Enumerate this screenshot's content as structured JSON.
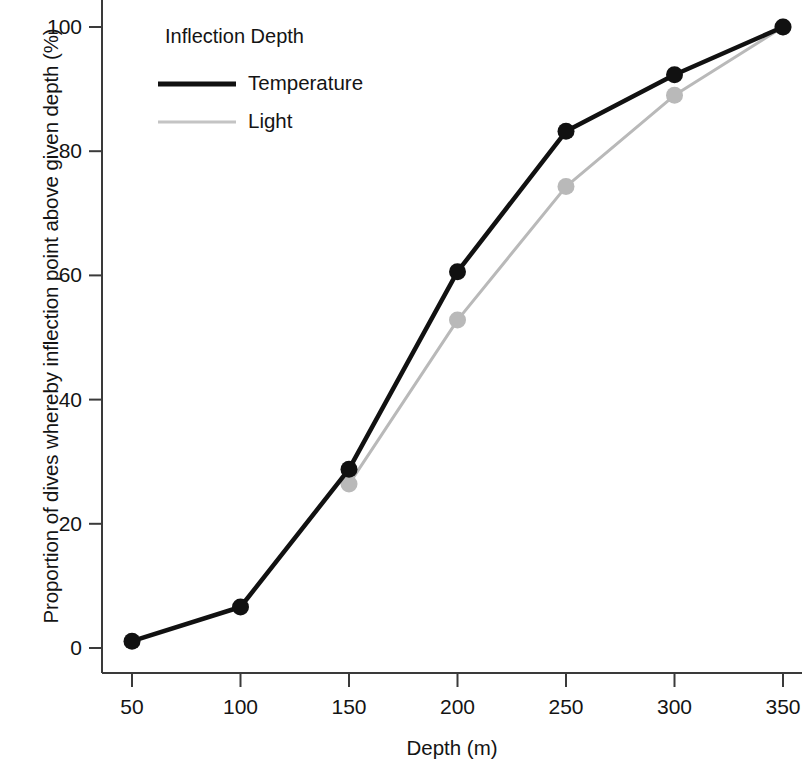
{
  "chart_data": {
    "type": "line",
    "title": "",
    "xlabel": "Depth (m)",
    "ylabel": "Proportion of dives whereby inflection point above given depth (%)",
    "x": [
      50,
      100,
      150,
      200,
      250,
      300,
      350
    ],
    "xlim": [
      35,
      365
    ],
    "ylim": [
      -4,
      104
    ],
    "xticks": [
      50,
      100,
      150,
      200,
      250,
      300,
      350
    ],
    "yticks": [
      0,
      20,
      40,
      60,
      80,
      100
    ],
    "xticklabels": [
      "50",
      "100",
      "150",
      "200",
      "250",
      "300",
      "350"
    ],
    "yticklabels": [
      "0",
      "20",
      "40",
      "60",
      "80",
      "100"
    ],
    "grid": false,
    "legend_position": "top-left-inside",
    "legend_title": "Inflection Depth",
    "series": [
      {
        "name": "Temperature",
        "color": "#111111",
        "linewidth": 4.5,
        "marker": "o",
        "x": [
          50,
          100,
          150,
          200,
          250,
          300,
          350
        ],
        "values": [
          1.1,
          6.6,
          28.8,
          60.6,
          83.2,
          92.3,
          100.0
        ]
      },
      {
        "name": "Light",
        "color": "#b9b9b9",
        "linewidth": 3.0,
        "marker": "o",
        "x": [
          150,
          200,
          250,
          300,
          350
        ],
        "values": [
          26.4,
          52.8,
          74.3,
          89.0,
          100.0
        ]
      }
    ]
  },
  "axes": {
    "y_title": "Proportion of dives whereby inflection point above given depth (%)",
    "x_title": "Depth (m)",
    "axis_color": "#3a3a3a"
  },
  "legend": {
    "title": "Inflection Depth",
    "items": [
      {
        "label": "Temperature",
        "color": "#111111"
      },
      {
        "label": "Light",
        "color": "#c4c4c4"
      }
    ]
  }
}
